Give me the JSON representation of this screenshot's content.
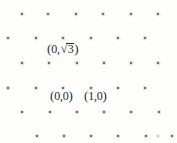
{
  "figure": {
    "background_color": "#fdfdfb",
    "dot_color": "#6f6f6f",
    "faint_dot_color": "#c8c8c8",
    "label_color": "#2b2b2b"
  },
  "labels": {
    "sqrt3": {
      "text": "(0,√3)",
      "open": "(",
      "x_value": "0",
      "comma": ",",
      "radical_sign": "√",
      "radical_arg": "3",
      "close": ")",
      "x": 47,
      "y": 42
    },
    "origin": {
      "text": "(0,0)",
      "open": "(",
      "x_value": "0",
      "comma": ",",
      "y_value": "0",
      "close": ")",
      "x": 50,
      "y": 89
    },
    "one_zero": {
      "text": "(1,0)",
      "open": "(",
      "x_value": "1",
      "comma": ",",
      "y_value": "0",
      "close": ")",
      "x": 84,
      "y": 89
    }
  },
  "chart_data": {
    "type": "scatter",
    "xlabel": "",
    "ylabel": "",
    "grid": false,
    "legend": null,
    "annotations": [
      {
        "label": "(0,√3)",
        "px": [
          47,
          42
        ]
      },
      {
        "label": "(0,0)",
        "px": [
          50,
          89
        ]
      },
      {
        "label": "(1,0)",
        "px": [
          84,
          89
        ]
      }
    ],
    "lattice": {
      "rows": 6,
      "columns_per_row": 6,
      "row_spacing_px": 24.6,
      "column_spacing_px": 27.3,
      "row_offset_px": 13.7,
      "description": "Triangular lattice: alternating rows shifted by half a column spacing"
    },
    "points_px": [
      {
        "x": 22,
        "y": 14
      },
      {
        "x": 48,
        "y": 14
      },
      {
        "x": 76,
        "y": 14
      },
      {
        "x": 103,
        "y": 14
      },
      {
        "x": 131,
        "y": 14
      },
      {
        "x": 158,
        "y": 14
      },
      {
        "x": 8,
        "y": 38
      },
      {
        "x": 36,
        "y": 38
      },
      {
        "x": 63,
        "y": 38
      },
      {
        "x": 91,
        "y": 38
      },
      {
        "x": 118,
        "y": 38
      },
      {
        "x": 145,
        "y": 38
      },
      {
        "x": 22,
        "y": 63
      },
      {
        "x": 49,
        "y": 63
      },
      {
        "x": 77,
        "y": 63
      },
      {
        "x": 104,
        "y": 63
      },
      {
        "x": 131,
        "y": 63
      },
      {
        "x": 158,
        "y": 63
      },
      {
        "x": 8,
        "y": 88
      },
      {
        "x": 36,
        "y": 88
      },
      {
        "x": 63,
        "y": 88
      },
      {
        "x": 91,
        "y": 88
      },
      {
        "x": 118,
        "y": 88
      },
      {
        "x": 145,
        "y": 88
      },
      {
        "x": 22,
        "y": 112
      },
      {
        "x": 50,
        "y": 112
      },
      {
        "x": 77,
        "y": 112
      },
      {
        "x": 104,
        "y": 112
      },
      {
        "x": 131,
        "y": 112
      },
      {
        "x": 159,
        "y": 112
      },
      {
        "x": 37,
        "y": 136
      },
      {
        "x": 64,
        "y": 136
      },
      {
        "x": 91,
        "y": 136
      },
      {
        "x": 118,
        "y": 136
      },
      {
        "x": 146,
        "y": 136
      },
      {
        "x": 172,
        "y": 136
      }
    ],
    "faint_points_px": [
      {
        "x": 158,
        "y": 136
      }
    ]
  }
}
